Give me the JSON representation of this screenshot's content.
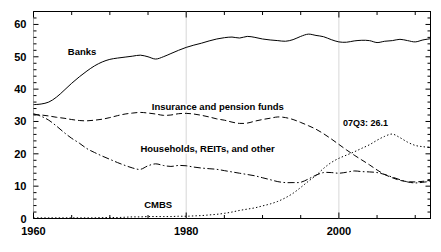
{
  "chart_data": {
    "type": "line",
    "title": "",
    "xlabel": "",
    "ylabel": "",
    "xlim": [
      1960,
      2012
    ],
    "ylim": [
      0,
      64
    ],
    "grid": false,
    "legend_position": "inline-labels",
    "x_ticks_major": [
      1960,
      1980,
      2000
    ],
    "x_tick_labels": [
      "1960",
      "1980",
      "2000"
    ],
    "x_ticks_minor_step": 5,
    "y_ticks": [
      0,
      10,
      20,
      30,
      40,
      50,
      60
    ],
    "y_tick_labels": [
      "0",
      "10",
      "20",
      "30",
      "40",
      "50",
      "60"
    ],
    "annotations": [
      {
        "text": "07Q3: 26.1",
        "x": 2003.5,
        "y": 28.5,
        "series": "CMBS",
        "value": 26.1,
        "period": "07Q3"
      }
    ],
    "series": [
      {
        "name": "Banks",
        "label": "Banks",
        "linestyle": "solid",
        "color": "#000000",
        "label_x": 1964.5,
        "label_y": 50.5,
        "x": [
          1960,
          1961,
          1962,
          1963,
          1964,
          1965,
          1966,
          1967,
          1968,
          1969,
          1970,
          1971,
          1972,
          1973,
          1974,
          1975,
          1976,
          1977,
          1978,
          1979,
          1980,
          1981,
          1982,
          1983,
          1984,
          1985,
          1986,
          1987,
          1988,
          1989,
          1990,
          1991,
          1992,
          1993,
          1994,
          1995,
          1996,
          1997,
          1998,
          1999,
          2000,
          2001,
          2002,
          2003,
          2004,
          2005,
          2006,
          2007,
          2008,
          2009,
          2010,
          2011,
          2012
        ],
        "y": [
          35.2,
          35.4,
          36.0,
          37.5,
          39.6,
          41.8,
          43.8,
          45.6,
          47.2,
          48.4,
          49.2,
          49.6,
          49.9,
          50.2,
          50.5,
          50.0,
          49.3,
          50.0,
          51.0,
          52.0,
          52.9,
          53.6,
          54.2,
          54.9,
          55.5,
          55.9,
          56.1,
          55.8,
          56.3,
          56.0,
          55.5,
          55.2,
          55.0,
          54.8,
          55.3,
          56.3,
          57.0,
          56.6,
          56.2,
          55.3,
          54.6,
          54.5,
          54.9,
          55.1,
          55.0,
          54.4,
          54.8,
          55.0,
          55.4,
          55.0,
          54.6,
          55.2,
          55.6
        ]
      },
      {
        "name": "Insurance and pension funds",
        "label": "Insurance and pension funds",
        "linestyle": "dashed",
        "color": "#000000",
        "label_x": 1975.5,
        "label_y": 33.5,
        "x": [
          1960,
          1961,
          1962,
          1963,
          1964,
          1965,
          1966,
          1967,
          1968,
          1969,
          1970,
          1971,
          1972,
          1973,
          1974,
          1975,
          1976,
          1977,
          1978,
          1979,
          1980,
          1981,
          1982,
          1983,
          1984,
          1985,
          1986,
          1987,
          1988,
          1989,
          1990,
          1991,
          1992,
          1993,
          1994,
          1995,
          1996,
          1997,
          1998,
          1999,
          2000,
          2001,
          2002,
          2003,
          2004,
          2005,
          2006,
          2007,
          2008,
          2009,
          2010,
          2011,
          2012
        ],
        "y": [
          32.2,
          32.0,
          31.7,
          31.3,
          31.0,
          30.6,
          30.3,
          30.2,
          30.4,
          30.7,
          31.2,
          31.8,
          32.3,
          32.6,
          32.8,
          32.6,
          32.3,
          31.9,
          32.0,
          32.4,
          32.5,
          32.3,
          31.9,
          31.4,
          30.8,
          30.4,
          29.8,
          29.4,
          29.5,
          30.1,
          30.6,
          31.0,
          31.4,
          31.2,
          30.6,
          29.7,
          28.7,
          27.6,
          26.2,
          24.6,
          22.9,
          21.2,
          19.6,
          18.1,
          16.6,
          15.0,
          13.6,
          12.6,
          11.8,
          11.4,
          11.3,
          11.5,
          11.8
        ]
      },
      {
        "name": "Households, REITs, and other",
        "label": "Households, REITs, and other",
        "linestyle": "dashdot",
        "color": "#000000",
        "label_x": 1974.0,
        "label_y": 20.5,
        "x": [
          1960,
          1961,
          1962,
          1963,
          1964,
          1965,
          1966,
          1967,
          1968,
          1969,
          1970,
          1971,
          1972,
          1973,
          1974,
          1975,
          1976,
          1977,
          1978,
          1979,
          1980,
          1981,
          1982,
          1983,
          1984,
          1985,
          1986,
          1987,
          1988,
          1989,
          1990,
          1991,
          1992,
          1993,
          1994,
          1995,
          1996,
          1997,
          1998,
          1999,
          2000,
          2001,
          2002,
          2003,
          2004,
          2005,
          2006,
          2007,
          2008,
          2009,
          2010,
          2011,
          2012
        ],
        "y": [
          32.4,
          31.6,
          30.4,
          28.6,
          26.6,
          24.8,
          23.3,
          21.6,
          20.4,
          19.3,
          18.3,
          17.3,
          16.4,
          15.6,
          15.2,
          16.3,
          16.9,
          16.4,
          16.1,
          16.4,
          16.3,
          15.9,
          15.6,
          15.4,
          15.2,
          14.8,
          14.4,
          14.0,
          13.6,
          13.2,
          12.6,
          12.0,
          11.4,
          11.1,
          11.1,
          11.2,
          12.2,
          13.4,
          14.2,
          14.2,
          14.0,
          14.3,
          14.7,
          14.5,
          14.4,
          14.2,
          13.6,
          12.8,
          12.0,
          11.3,
          11.0,
          11.2,
          11.5
        ]
      },
      {
        "name": "CMBS",
        "label": "CMBS",
        "linestyle": "dotted",
        "color": "#000000",
        "label_x": 1974.5,
        "label_y": 3.2,
        "x": [
          1960,
          1961,
          1962,
          1963,
          1964,
          1965,
          1966,
          1967,
          1968,
          1969,
          1970,
          1971,
          1972,
          1973,
          1974,
          1975,
          1976,
          1977,
          1978,
          1979,
          1980,
          1981,
          1982,
          1983,
          1984,
          1985,
          1986,
          1987,
          1988,
          1989,
          1990,
          1991,
          1992,
          1993,
          1994,
          1995,
          1996,
          1997,
          1998,
          1999,
          2000,
          2001,
          2002,
          2003,
          2004,
          2005,
          2006,
          2007,
          2008,
          2009,
          2010,
          2011,
          2012
        ],
        "y": [
          0.2,
          0.2,
          0.2,
          0.2,
          0.2,
          0.2,
          0.2,
          0.2,
          0.2,
          0.3,
          0.3,
          0.3,
          0.4,
          0.5,
          0.5,
          0.6,
          0.6,
          0.6,
          0.6,
          0.7,
          0.7,
          0.8,
          0.9,
          1.1,
          1.3,
          1.6,
          2.0,
          2.5,
          2.9,
          3.3,
          3.9,
          4.5,
          5.3,
          6.4,
          7.8,
          9.6,
          11.5,
          13.3,
          15.5,
          17.3,
          18.6,
          19.6,
          20.6,
          21.7,
          22.8,
          24.2,
          25.4,
          26.1,
          25.0,
          23.6,
          22.6,
          22.2,
          22.0
        ]
      }
    ]
  }
}
